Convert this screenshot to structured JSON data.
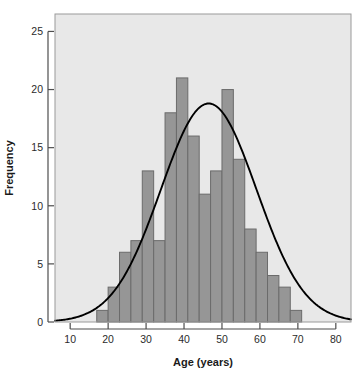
{
  "chart": {
    "type": "histogram",
    "title": "",
    "y_axis_label": "Frequency",
    "x_axis_label": "Age (years)"
  },
  "colors": {
    "panel_background": "#e8e8e8",
    "bar_fill": "#969696",
    "bar_stroke": "#6b6b6b",
    "curve": "#000000",
    "axis": "#4d4d4d",
    "frame": "#9a9a9a",
    "text": "#1a1a1a"
  },
  "chart_data": {
    "type": "bar",
    "title": "",
    "xlabel": "Age (years)",
    "ylabel": "Frequency",
    "xlim": [
      6,
      84
    ],
    "ylim": [
      0,
      26.5
    ],
    "xticks": [
      10,
      20,
      30,
      40,
      50,
      60,
      70,
      80
    ],
    "yticks": [
      0,
      5,
      10,
      15,
      20,
      25
    ],
    "xtick_labels": [
      "10",
      "20",
      "30",
      "40",
      "50",
      "60",
      "70",
      "80"
    ],
    "ytick_labels": [
      "0",
      "5",
      "10",
      "15",
      "20",
      "25"
    ],
    "grid": false,
    "legend": "none",
    "bin_width": 3,
    "bin_edges": [
      17,
      20,
      23,
      26,
      29,
      32,
      35,
      38,
      41,
      44,
      47,
      50,
      53,
      56,
      59,
      62,
      65,
      68,
      71,
      74,
      77
    ],
    "categories": [
      "17-20",
      "20-23",
      "23-26",
      "26-29",
      "29-32",
      "32-35",
      "35-38",
      "38-41",
      "41-44",
      "44-47",
      "47-50",
      "50-53",
      "53-56",
      "56-59",
      "59-62",
      "62-65",
      "65-68",
      "68-71",
      "71-74",
      "74-77"
    ],
    "values": [
      1,
      3,
      6,
      7,
      13,
      7,
      18,
      21,
      16,
      11,
      13,
      20,
      14,
      8,
      6,
      4,
      3,
      1,
      0,
      0
    ],
    "series": [
      {
        "name": "Frequency",
        "values": [
          1,
          3,
          6,
          7,
          13,
          7,
          18,
          21,
          16,
          11,
          13,
          20,
          14,
          8,
          6,
          4,
          3,
          1,
          0,
          0
        ]
      }
    ],
    "overlay_curve": {
      "name": "Normal density",
      "type": "line",
      "mean": 46.5,
      "sd": 12.6,
      "peak_value": 18.8,
      "x_start": 6,
      "x_end": 84
    }
  }
}
